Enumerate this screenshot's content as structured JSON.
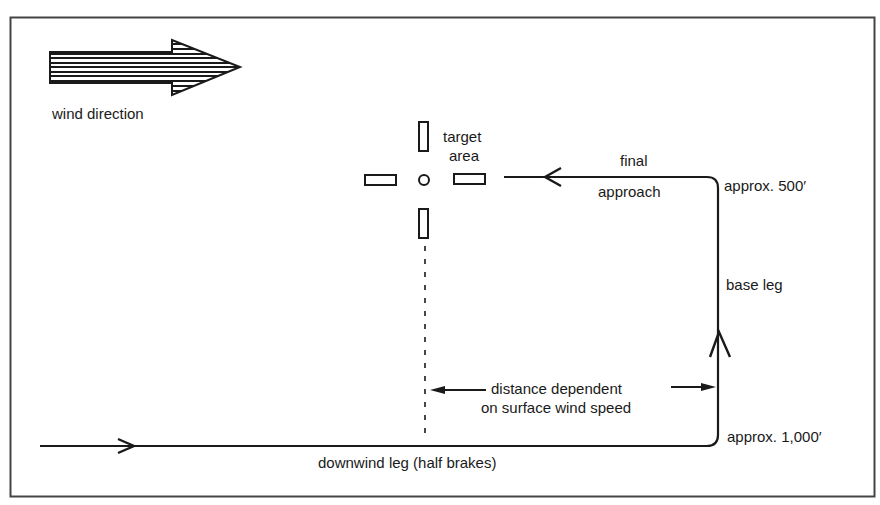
{
  "diagram": {
    "type": "landing-pattern",
    "labels": {
      "wind_direction": "wind direction",
      "target_area_line1": "target",
      "target_area_line2": "area",
      "final_approach_line1": "final",
      "final_approach_line2": "approach",
      "final_altitude": "approx. 500′",
      "base_leg": "base leg",
      "distance_line1": "distance dependent",
      "distance_line2": "on surface wind speed",
      "downwind_altitude": "approx. 1,000′",
      "downwind_leg": "downwind leg (half brakes)"
    },
    "colors": {
      "ink": "#1a1a1a",
      "background": "#ffffff",
      "frame": "#444444"
    }
  }
}
